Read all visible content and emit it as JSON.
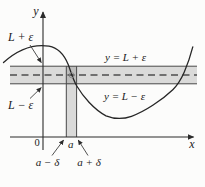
{
  "figure": {
    "labels": {
      "y_axis": "y",
      "x_axis": "x",
      "origin": "0",
      "upper_bound_left": "L + ε",
      "lower_bound_left": "L − ε",
      "upper_line": "y = L + ε",
      "lower_line": "y = L − ε",
      "a": "a",
      "a_minus_delta": "a − δ",
      "a_plus_delta": "a + δ"
    },
    "colors": {
      "background": "#fcfcfb",
      "band_fill": "rgba(0,0,0,0.135)",
      "curve": "#262626",
      "circle_stroke": "#8a8a8a"
    }
  }
}
